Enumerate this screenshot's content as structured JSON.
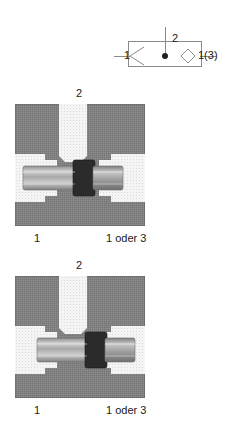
{
  "symbol": {
    "name": "shuttle-valve-symbol",
    "port_left_label": "1",
    "port_top_label": "2",
    "port_right_label": "1(3)",
    "line_color": "#8a8a8a",
    "dot_color": "#1f1f1f"
  },
  "diagrams": [
    {
      "name": "cross-section-ball-left",
      "port_top_label": "2",
      "port_left_label": "1",
      "port_right_label": "1 oder 3",
      "spool_position": "left",
      "seal_x": 58,
      "body_color": "#808080",
      "cavity_color": "#f2f2f2",
      "spool_color": "#9e9e9e",
      "seal_color": "#2b2b2b"
    },
    {
      "name": "cross-section-ball-right",
      "port_top_label": "2",
      "port_left_label": "1",
      "port_right_label": "1 oder 3",
      "spool_position": "right",
      "seal_x": 72,
      "body_color": "#808080",
      "cavity_color": "#f2f2f2",
      "spool_color": "#9e9e9e",
      "seal_color": "#2b2b2b"
    }
  ],
  "colors": {
    "background": "#ffffff",
    "text": "#1a1a1a",
    "body_gray": "#808080",
    "cavity_light": "#f2f2f2",
    "outline": "#3a3a3a"
  }
}
